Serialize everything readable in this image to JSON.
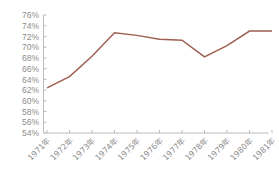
{
  "chart_data": {
    "type": "line",
    "title": "",
    "xlabel": "",
    "ylabel": "",
    "grid": false,
    "legend": "none",
    "categories": [
      "1971年",
      "1972年",
      "1973年",
      "1974年",
      "1975年",
      "1976年",
      "1977年",
      "1978年",
      "1979年",
      "1980年",
      "1981年"
    ],
    "x": [
      1971,
      1972,
      1973,
      1974,
      1975,
      1976,
      1977,
      1978,
      1979,
      1980,
      1981
    ],
    "values": [
      62.4,
      64.5,
      68.3,
      72.7,
      72.2,
      71.5,
      71.3,
      68.2,
      70.3,
      73.0,
      73.0
    ],
    "ylim": [
      54,
      76
    ],
    "ytick_values": [
      54,
      56,
      58,
      60,
      62,
      64,
      66,
      68,
      70,
      72,
      74,
      76
    ],
    "ytick_labels": [
      "54%",
      "56%",
      "58%",
      "60%",
      "62%",
      "64%",
      "66%",
      "68%",
      "70%",
      "72%",
      "74%",
      "76%"
    ],
    "series": [
      {
        "name": "series-1",
        "color": "#9e5f50",
        "values": [
          62.4,
          64.5,
          68.3,
          72.7,
          72.2,
          71.5,
          71.3,
          68.2,
          70.3,
          73.0,
          73.0
        ]
      }
    ]
  },
  "colors": {
    "line": "#9e5f50",
    "axis": "#b4b4b4",
    "tick_text": "#8d8d8d",
    "background": "#ffffff"
  }
}
